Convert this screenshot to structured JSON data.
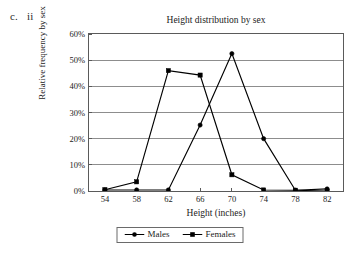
{
  "outline": {
    "letter": "c.",
    "numeral": "ii"
  },
  "chart_data": {
    "type": "line",
    "title": "Height distribution by sex",
    "xlabel": "Height (inches)",
    "ylabel": "Relative frequency by sex",
    "x": [
      54,
      58,
      62,
      66,
      70,
      74,
      78,
      82
    ],
    "xtick_labels": [
      "54",
      "58",
      "62",
      "66",
      "70",
      "74",
      "78",
      "82"
    ],
    "ytick_labels": [
      "0%",
      "10%",
      "20%",
      "30%",
      "40%",
      "50%",
      "60%"
    ],
    "ytick_values": [
      0,
      10,
      20,
      30,
      40,
      50,
      60
    ],
    "xlim": [
      52,
      84
    ],
    "ylim": [
      0,
      60
    ],
    "grid": "horizontal",
    "legend_position": "bottom",
    "series": [
      {
        "name": "Males",
        "marker": "circle",
        "color": "#000000",
        "values": [
          0.4,
          0.4,
          0.4,
          25.2,
          52.5,
          20.0,
          0.3,
          0.8
        ]
      },
      {
        "name": "Females",
        "marker": "square",
        "color": "#000000",
        "values": [
          0.5,
          3.5,
          46.0,
          44.3,
          6.2,
          0.4,
          0.3,
          0.0
        ]
      }
    ]
  }
}
